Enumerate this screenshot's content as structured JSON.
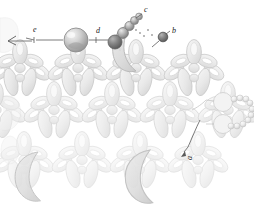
{
  "figure": {
    "background_color": "#ffffff",
    "width": 254,
    "height": 210,
    "labels": [
      {
        "id": "a",
        "text": "a",
        "x": 186,
        "y": 160,
        "rotated": true
      },
      {
        "id": "b",
        "text": "b",
        "x": 171,
        "y": 33,
        "rotated": false
      },
      {
        "id": "c",
        "text": "c",
        "x": 144,
        "y": 12,
        "rotated": false
      },
      {
        "id": "d",
        "text": "d",
        "x": 96,
        "y": 33,
        "rotated": false
      },
      {
        "id": "e",
        "text": "e",
        "x": 33,
        "y": 32,
        "rotated": false
      }
    ],
    "colors": {
      "outline": "#b9b9b9",
      "pale_fill": "#ededed",
      "light_fill": "#e2e2e2",
      "mid_fill": "#cfcfcf",
      "dark_sphere": "#7d7d7d",
      "darker_sphere": "#5f5f5f",
      "leader_line": "#5a5a5a",
      "label_text": "#1a1a1a",
      "crescent_fill": "#dcdcdc"
    },
    "elements": {
      "central_sphere": {
        "cx": 76,
        "cy": 40,
        "r": 12,
        "shading": "radial-gradient"
      },
      "bead_chain_top": {
        "description": "chain of graded spheres rising to label c",
        "beads": [
          {
            "cx": 115,
            "cy": 42,
            "r": 7.0,
            "tone": "#8a8a8a"
          },
          {
            "cx": 123,
            "cy": 33,
            "r": 5.4,
            "tone": "#9c9c9c"
          },
          {
            "cx": 129,
            "cy": 26,
            "r": 4.6,
            "tone": "#a8a8a8"
          },
          {
            "cx": 134,
            "cy": 21,
            "r": 4.0,
            "tone": "#b4b4b4"
          },
          {
            "cx": 139,
            "cy": 17,
            "r": 3.4,
            "tone": "#bfbfbf"
          }
        ]
      },
      "dark_sphere_b": {
        "cx": 163,
        "cy": 37,
        "r": 4.6,
        "tone": "#6a6a6a"
      },
      "bead_loop_right": {
        "description": "loop of small beads at right margin",
        "count": 18
      },
      "leader_lines": [
        {
          "from": "e",
          "to": "left-arrowhead",
          "style": "solid-with-arrow"
        },
        {
          "from": "d",
          "to": "central-sphere",
          "style": "dashed-with-tick"
        },
        {
          "from": "c",
          "to": "bead-chain",
          "style": "short-tick"
        },
        {
          "from": "b",
          "to": "dark-sphere",
          "style": "short-tick"
        },
        {
          "from": "a",
          "to": "complex-arm",
          "style": "short-tick"
        }
      ]
    }
  }
}
